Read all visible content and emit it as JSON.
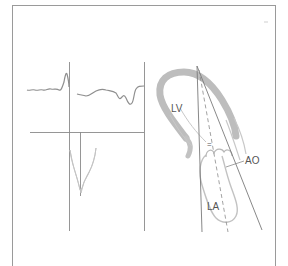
{
  "figure": {
    "type": "echocardiogram schematic",
    "panels": [
      {
        "name": "doppler-trace-panel",
        "content": "ECG-like waveform above, spectral doppler envelope below"
      },
      {
        "name": "heart-cross-section-panel",
        "content": "apical long-axis view with ultrasound beam lines"
      }
    ],
    "labels": {
      "lv": "LV",
      "ao": "AO",
      "la": "LA",
      "marker": "="
    },
    "colors": {
      "frame": "#9a9a9a",
      "trace": "#8f8f8f",
      "wall": "#bdbdbd",
      "doppler": "#c4c4c4",
      "text": "#555555"
    }
  }
}
